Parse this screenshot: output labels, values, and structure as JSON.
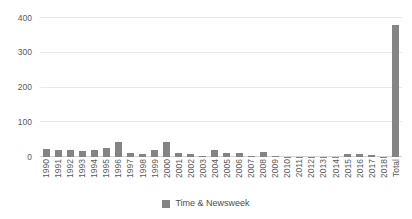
{
  "chart_data": {
    "type": "bar",
    "title": "",
    "subtitle": "",
    "xlabel": "",
    "ylabel": "",
    "ylim": [
      0,
      400
    ],
    "yticks": [
      0,
      100,
      200,
      300,
      400
    ],
    "ytick_labels": [
      "0",
      "100",
      "200",
      "300",
      "400"
    ],
    "grid": true,
    "legend_position": "bottom",
    "bar_color": "#848484",
    "gridline_color": "#e8e8e8",
    "axis_color": "#d4d4d4",
    "tick_label_color": "#5a5a5a",
    "categories": [
      "1990",
      "1991",
      "1992",
      "1993",
      "1994",
      "1995",
      "1996",
      "1997",
      "1998",
      "1999",
      "2000",
      "2001",
      "2002",
      "2003",
      "2004",
      "2005",
      "2006",
      "2007",
      "2008",
      "2009",
      "2010",
      "2011",
      "2012",
      "2013",
      "2014",
      "2015",
      "2016",
      "2017",
      "2018",
      "Total"
    ],
    "series": [
      {
        "name": "Time & Newsweek",
        "color": "#848484",
        "values": [
          22,
          20,
          20,
          16,
          19,
          26,
          42,
          11,
          9,
          21,
          44,
          12,
          8,
          2,
          20,
          11,
          11,
          3,
          15,
          3,
          1,
          1,
          1,
          1,
          1,
          10,
          8,
          5,
          1,
          380
        ]
      }
    ],
    "legend": [
      {
        "label": "Time & Newsweek",
        "color": "#848484"
      }
    ]
  }
}
